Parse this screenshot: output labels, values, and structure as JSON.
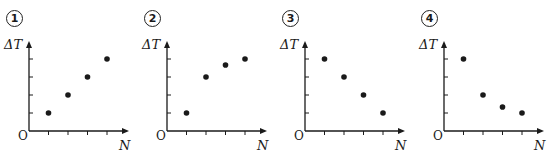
{
  "chart_data": [
    {
      "type": "scatter",
      "label": "①",
      "title": "",
      "xlabel": "N",
      "ylabel": "ΔT",
      "origin_label": "O",
      "x": [
        1,
        2,
        3,
        4
      ],
      "values": [
        1,
        2,
        3,
        4
      ],
      "ylim": [
        0,
        4.8
      ],
      "xlim": [
        0,
        5
      ],
      "grid": false,
      "tick_labels": false
    },
    {
      "type": "scatter",
      "label": "②",
      "title": "",
      "xlabel": "N",
      "ylabel": "ΔT",
      "origin_label": "O",
      "x": [
        1,
        2,
        3,
        4
      ],
      "values": [
        1,
        3,
        3.67,
        4
      ],
      "ylim": [
        0,
        4.8
      ],
      "xlim": [
        0,
        5
      ],
      "grid": false,
      "tick_labels": false
    },
    {
      "type": "scatter",
      "label": "③",
      "title": "",
      "xlabel": "N",
      "ylabel": "ΔT",
      "origin_label": "O",
      "x": [
        1,
        2,
        3,
        4
      ],
      "values": [
        4,
        3,
        2,
        1
      ],
      "ylim": [
        0,
        4.8
      ],
      "xlim": [
        0,
        5
      ],
      "grid": false,
      "tick_labels": false
    },
    {
      "type": "scatter",
      "label": "④",
      "title": "",
      "xlabel": "N",
      "ylabel": "ΔT",
      "origin_label": "O",
      "x": [
        1,
        2,
        3,
        4
      ],
      "values": [
        4,
        2,
        1.33,
        1
      ],
      "ylim": [
        0,
        4.8
      ],
      "xlim": [
        0,
        5
      ],
      "grid": false,
      "tick_labels": false
    }
  ],
  "panels": [
    {
      "number": "1",
      "ylabel": "ΔT",
      "origin": "O",
      "xlabel": "N"
    },
    {
      "number": "2",
      "ylabel": "ΔT",
      "origin": "O",
      "xlabel": "N"
    },
    {
      "number": "3",
      "ylabel": "ΔT",
      "origin": "O",
      "xlabel": "N"
    },
    {
      "number": "4",
      "ylabel": "ΔT",
      "origin": "O",
      "xlabel": "N"
    }
  ],
  "colors": {
    "ink": "#1a1a1a",
    "background": "#ffffff"
  }
}
